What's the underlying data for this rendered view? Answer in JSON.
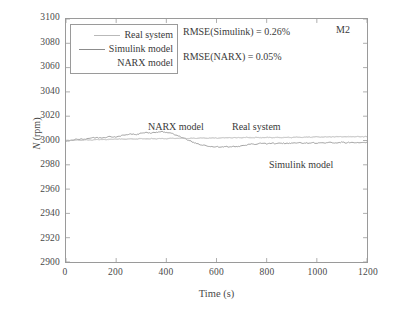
{
  "figure": {
    "corner_label": "M2",
    "background": "#ffffff",
    "frame_color": "#9a9a9a"
  },
  "legend": {
    "entries": [
      {
        "label": "Real system",
        "color": "#b9b9b9",
        "sample": true
      },
      {
        "label": "Simulink model",
        "color": "#8c8c8c",
        "sample": true
      },
      {
        "label": "NARX model",
        "color": "#ffffff",
        "sample": false
      }
    ]
  },
  "metrics": {
    "simulink": "RMSE(Simulink) = 0.26%",
    "narx": "RMSE(NARX) = 0.05%"
  },
  "annotations": {
    "narx": "NARX model",
    "real": "Real system",
    "simulink": "Simulink model"
  },
  "chart_data": {
    "type": "line",
    "title": "",
    "subtitle": "",
    "corner_annotation": "M2",
    "xlabel": "Time (s)",
    "ylabel": "N (rpm)",
    "xlim": [
      0,
      1200
    ],
    "ylim": [
      2900,
      3100
    ],
    "xticks": [
      0,
      200,
      400,
      600,
      800,
      1000,
      1200
    ],
    "yticks": [
      2900,
      2920,
      2940,
      2960,
      2980,
      3000,
      3020,
      3040,
      3060,
      3080,
      3100
    ],
    "grid": false,
    "legend_position": "upper-left",
    "annotations": [
      {
        "text": "NARX model",
        "x": 330,
        "y": 3012
      },
      {
        "text": "Real system",
        "x": 690,
        "y": 3012
      },
      {
        "text": "Simulink model",
        "x": 840,
        "y": 2981
      }
    ],
    "metrics": {
      "RMSE_Simulink_pct": 0.26,
      "RMSE_NARX_pct": 0.05
    },
    "series": [
      {
        "name": "Real system",
        "color": "#b9b9b9",
        "x": [
          0,
          20,
          40,
          60,
          80,
          100,
          120,
          140,
          160,
          180,
          200,
          220,
          240,
          260,
          280,
          300,
          320,
          340,
          360,
          380,
          400,
          420,
          440,
          460,
          480,
          500,
          520,
          540,
          560,
          580,
          600,
          620,
          640,
          660,
          680,
          700,
          720,
          740,
          760,
          780,
          800,
          820,
          840,
          860,
          880,
          900,
          920,
          940,
          960,
          980,
          1000,
          1020,
          1040,
          1060,
          1080,
          1100,
          1120,
          1140,
          1160,
          1180
        ],
        "y": [
          3000.2,
          3000.0,
          3000.4,
          3000.1,
          3000.6,
          3000.3,
          3000.8,
          3001.0,
          3000.7,
          3001.2,
          3001.0,
          3001.4,
          3001.1,
          3001.5,
          3001.2,
          3001.6,
          3001.3,
          3001.7,
          3001.4,
          3001.8,
          3001.5,
          3001.9,
          3001.6,
          3002.0,
          3001.7,
          3002.1,
          3001.8,
          3002.2,
          3001.9,
          3002.3,
          3002.0,
          3002.2,
          3002.4,
          3002.1,
          3002.5,
          3002.2,
          3002.6,
          3002.3,
          3002.7,
          3002.4,
          3002.6,
          3002.3,
          3002.7,
          3002.4,
          3002.8,
          3002.5,
          3002.9,
          3002.6,
          3003.0,
          3002.7,
          3003.1,
          3002.8,
          3003.2,
          3002.9,
          3003.3,
          3003.0,
          3003.2,
          3003.1,
          3003.3,
          3003.2
        ]
      },
      {
        "name": "Simulink model",
        "color": "#8c8c8c",
        "x": [
          0,
          20,
          40,
          60,
          80,
          100,
          120,
          140,
          160,
          180,
          200,
          220,
          240,
          260,
          280,
          300,
          320,
          340,
          360,
          380,
          400,
          420,
          440,
          460,
          480,
          500,
          520,
          540,
          560,
          580,
          600,
          620,
          640,
          660,
          680,
          700,
          720,
          740,
          760,
          780,
          800,
          820,
          840,
          860,
          880,
          900,
          920,
          940,
          960,
          980,
          1000,
          1020,
          1040,
          1060,
          1080,
          1100,
          1120,
          1140,
          1160,
          1180
        ],
        "y": [
          2999.5,
          3000.0,
          3000.8,
          3001.4,
          3001.2,
          3001.9,
          3002.3,
          3002.0,
          3002.8,
          3003.2,
          3003.0,
          3003.8,
          3004.6,
          3005.2,
          3005.0,
          3005.9,
          3006.4,
          3006.0,
          3006.8,
          3007.4,
          3006.5,
          3005.8,
          3004.2,
          3002.6,
          3001.0,
          2999.2,
          2997.6,
          2996.4,
          2995.5,
          2995.0,
          2994.8,
          2994.5,
          2994.9,
          2994.6,
          2995.2,
          2995.6,
          2996.4,
          2997.2,
          2997.0,
          2997.6,
          2997.3,
          2997.8,
          2997.5,
          2997.9,
          2997.6,
          2998.0,
          2997.7,
          2998.1,
          2997.8,
          2998.2,
          2997.9,
          2998.3,
          2998.0,
          2998.4,
          2998.1,
          2998.5,
          2998.2,
          2998.6,
          2998.3,
          2998.5
        ]
      },
      {
        "name": "NARX model",
        "color": "#c8c8c8",
        "x": [
          0,
          20,
          40,
          60,
          80,
          100,
          120,
          140,
          160,
          180,
          200,
          220,
          240,
          260,
          280,
          300,
          320,
          340,
          360,
          380,
          400,
          420,
          440,
          460,
          480,
          500,
          520,
          540,
          560,
          580,
          600,
          620,
          640,
          660,
          680,
          700,
          720,
          740,
          760,
          780,
          800,
          820,
          840,
          860,
          880,
          900,
          920,
          940,
          960,
          980,
          1000,
          1020,
          1040,
          1060,
          1080,
          1100,
          1120,
          1140,
          1160,
          1180
        ],
        "y": [
          3000.0,
          3000.1,
          3000.3,
          3000.2,
          3000.5,
          3000.4,
          3000.7,
          3000.9,
          3000.6,
          3001.1,
          3000.9,
          3001.3,
          3001.0,
          3001.4,
          3001.1,
          3001.5,
          3001.2,
          3001.6,
          3001.3,
          3001.7,
          3001.4,
          3001.8,
          3001.5,
          3001.9,
          3001.6,
          3002.0,
          3001.7,
          3002.1,
          3001.8,
          3002.2,
          3001.9,
          3002.1,
          3002.3,
          3002.0,
          3002.4,
          3002.1,
          3002.5,
          3002.2,
          3002.6,
          3002.3,
          3002.5,
          3002.2,
          3002.6,
          3002.3,
          3002.7,
          3002.4,
          3002.8,
          3002.5,
          3002.9,
          3002.6,
          3003.0,
          3002.7,
          3003.1,
          3002.8,
          3003.2,
          3002.9,
          3003.1,
          3003.0,
          3003.2,
          3003.1
        ]
      }
    ]
  }
}
